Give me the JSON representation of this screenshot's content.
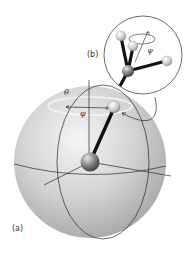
{
  "figure": {
    "panel_a_label": "(a)",
    "panel_b_label": "(b)",
    "angle_theta": "θ",
    "angle_phi": "φ",
    "angle_psi": "ψ"
  },
  "colors": {
    "background": "#ffffff",
    "sphere_light": "#f2f2f2",
    "sphere_mid": "#c8c8c8",
    "sphere_dark": "#9a9a9a",
    "lines": "#2a2a2a",
    "bond": "#111111",
    "atom_light": "#e8e8e8",
    "atom_dark": "#555555"
  }
}
